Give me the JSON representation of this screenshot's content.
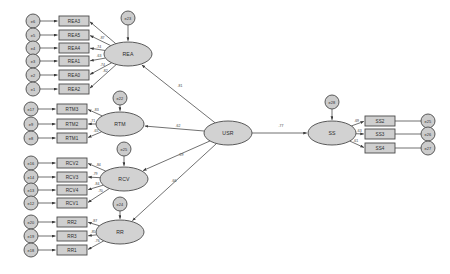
{
  "diagram": {
    "type": "sem-path-diagram",
    "title": "",
    "background_color": "#ffffff",
    "node_fill": "#cfcfcf",
    "node_stroke": "#4a4a4a",
    "edge_color": "#4d4d4d"
  },
  "latent_variables": [
    {
      "id": "REA",
      "label": "REA",
      "x": 128,
      "y": 54,
      "rx": 24,
      "ry": 12
    },
    {
      "id": "RTM",
      "label": "RTM",
      "x": 120,
      "y": 124,
      "rx": 24,
      "ry": 12
    },
    {
      "id": "RCV",
      "label": "RCV",
      "x": 124,
      "y": 179,
      "rx": 24,
      "ry": 12
    },
    {
      "id": "RR",
      "label": "RR",
      "x": 120,
      "y": 232,
      "rx": 24,
      "ry": 12
    },
    {
      "id": "USR",
      "label": "USR",
      "x": 228,
      "y": 133,
      "rx": 24,
      "ry": 12
    },
    {
      "id": "SS",
      "label": "SS",
      "x": 332,
      "y": 133,
      "rx": 24,
      "ry": 12
    }
  ],
  "disturbances": [
    {
      "id": "e23",
      "label": "e23",
      "x": 128,
      "y": 18,
      "r": 7,
      "target": "REA"
    },
    {
      "id": "e22",
      "label": "e22",
      "x": 120,
      "y": 98,
      "r": 7,
      "target": "RTM"
    },
    {
      "id": "e25d",
      "label": "e25",
      "x": 124,
      "y": 149,
      "r": 7,
      "target": "RCV"
    },
    {
      "id": "e24",
      "label": "e24",
      "x": 120,
      "y": 204,
      "r": 7,
      "target": "RR"
    },
    {
      "id": "e28",
      "label": "e28",
      "x": 332,
      "y": 102,
      "r": 7,
      "target": "SS"
    }
  ],
  "indicators": [
    {
      "id": "REA3",
      "label": "REA3",
      "x": 74,
      "y": 21,
      "w": 30,
      "h": 10,
      "latent": "REA",
      "error": "e6",
      "coef": ""
    },
    {
      "id": "REA5",
      "label": "REA5",
      "x": 74,
      "y": 35,
      "w": 30,
      "h": 10,
      "latent": "REA",
      "error": "e5",
      "coef": ".87"
    },
    {
      "id": "REA4",
      "label": "REA4",
      "x": 74,
      "y": 48,
      "w": 30,
      "h": 10,
      "latent": "REA",
      "error": "e4",
      "coef": ".74"
    },
    {
      "id": "REA1",
      "label": "REA1",
      "x": 74,
      "y": 61,
      "w": 30,
      "h": 10,
      "latent": "REA",
      "error": "e3",
      "coef": ".63"
    },
    {
      "id": "REA0",
      "label": "REA0",
      "x": 74,
      "y": 75,
      "w": 30,
      "h": 10,
      "latent": "REA",
      "error": "e2",
      "coef": ".74"
    },
    {
      "id": "REA2",
      "label": "REA2",
      "x": 74,
      "y": 89,
      "w": 30,
      "h": 10,
      "latent": "REA",
      "error": "e1",
      "coef": ".82"
    },
    {
      "id": "RTM3",
      "label": "RTM3",
      "x": 72,
      "y": 109,
      "w": 30,
      "h": 10,
      "latent": "RTM",
      "error": "e17",
      "coef": ".83"
    },
    {
      "id": "RTM2",
      "label": "RTM2",
      "x": 72,
      "y": 124,
      "w": 30,
      "h": 10,
      "latent": "RTM",
      "error": "e9",
      "coef": ".71"
    },
    {
      "id": "RTM1",
      "label": "RTM1",
      "x": 72,
      "y": 138,
      "w": 30,
      "h": 10,
      "latent": "RTM",
      "error": "e8",
      "coef": ".65"
    },
    {
      "id": "RCV2",
      "label": "RCV2",
      "x": 72,
      "y": 163,
      "w": 30,
      "h": 10,
      "latent": "RCV",
      "error": "e16",
      "coef": ".84"
    },
    {
      "id": "RCV3",
      "label": "RCV3",
      "x": 72,
      "y": 177,
      "w": 30,
      "h": 10,
      "latent": "RCV",
      "error": "e14",
      "coef": ".79"
    },
    {
      "id": "RCV4",
      "label": "RCV4",
      "x": 72,
      "y": 190,
      "w": 30,
      "h": 10,
      "latent": "RCV",
      "error": "e13",
      "coef": ".84"
    },
    {
      "id": "RCV1",
      "label": "RCV1",
      "x": 72,
      "y": 203,
      "w": 30,
      "h": 10,
      "latent": "RCV",
      "error": "e12",
      "coef": ".70"
    },
    {
      "id": "RR2",
      "label": "RR2",
      "x": 72,
      "y": 222,
      "w": 30,
      "h": 10,
      "latent": "RR",
      "error": "e20",
      "coef": ".87"
    },
    {
      "id": "RR3",
      "label": "RR3",
      "x": 72,
      "y": 236,
      "w": 30,
      "h": 10,
      "latent": "RR",
      "error": "e19",
      "coef": ".85"
    },
    {
      "id": "RR1",
      "label": "RR1",
      "x": 72,
      "y": 250,
      "w": 30,
      "h": 10,
      "latent": "RR",
      "error": "e18",
      "coef": ".76"
    },
    {
      "id": "SS2",
      "label": "SS2",
      "x": 380,
      "y": 121,
      "w": 30,
      "h": 10,
      "latent": "SS",
      "error": "e25",
      "coef": ".69"
    },
    {
      "id": "SS3",
      "label": "SS3",
      "x": 380,
      "y": 134,
      "w": 30,
      "h": 10,
      "latent": "SS",
      "error": "e26",
      "coef": ".63"
    },
    {
      "id": "SS4",
      "label": "SS4",
      "x": 380,
      "y": 148,
      "w": 30,
      "h": 10,
      "latent": "SS",
      "error": "e27",
      "coef": ".61"
    }
  ],
  "error_terms": [
    {
      "id": "e6",
      "label": "e6",
      "x": 33,
      "y": 21,
      "r": 7
    },
    {
      "id": "e5",
      "label": "e5",
      "x": 33,
      "y": 35,
      "r": 7
    },
    {
      "id": "e4",
      "label": "e4",
      "x": 33,
      "y": 48,
      "r": 7
    },
    {
      "id": "e3",
      "label": "e3",
      "x": 33,
      "y": 61,
      "r": 7
    },
    {
      "id": "e2",
      "label": "e2",
      "x": 33,
      "y": 75,
      "r": 7
    },
    {
      "id": "e1",
      "label": "e1",
      "x": 33,
      "y": 89,
      "r": 7
    },
    {
      "id": "e17",
      "label": "e17",
      "x": 31,
      "y": 109,
      "r": 7
    },
    {
      "id": "e9",
      "label": "e9",
      "x": 31,
      "y": 124,
      "r": 7
    },
    {
      "id": "e8",
      "label": "e8",
      "x": 31,
      "y": 138,
      "r": 7
    },
    {
      "id": "e16",
      "label": "e16",
      "x": 31,
      "y": 163,
      "r": 7
    },
    {
      "id": "e14",
      "label": "e14",
      "x": 31,
      "y": 177,
      "r": 7
    },
    {
      "id": "e13",
      "label": "e13",
      "x": 31,
      "y": 190,
      "r": 7
    },
    {
      "id": "e12",
      "label": "e12",
      "x": 31,
      "y": 203,
      "r": 7
    },
    {
      "id": "e20",
      "label": "e20",
      "x": 31,
      "y": 222,
      "r": 7
    },
    {
      "id": "e19",
      "label": "e19",
      "x": 31,
      "y": 236,
      "r": 7
    },
    {
      "id": "e18",
      "label": "e18",
      "x": 31,
      "y": 250,
      "r": 7
    },
    {
      "id": "e25",
      "label": "e25",
      "x": 428,
      "y": 121,
      "r": 7
    },
    {
      "id": "e26",
      "label": "e26",
      "x": 428,
      "y": 134,
      "r": 7
    },
    {
      "id": "e27",
      "label": "e27",
      "x": 428,
      "y": 148,
      "r": 7
    }
  ],
  "structural_paths": [
    {
      "id": "usr-rea",
      "from": "USR",
      "to": "REA",
      "coef": ".81",
      "label_x": 180,
      "label_y": 86
    },
    {
      "id": "usr-rtm",
      "from": "USR",
      "to": "RTM",
      "coef": ".62",
      "label_x": 178,
      "label_y": 126
    },
    {
      "id": "usr-rcv",
      "from": "USR",
      "to": "RCV",
      "coef": ".59",
      "label_x": 181,
      "label_y": 155
    },
    {
      "id": "usr-rr",
      "from": "USR",
      "to": "RR",
      "coef": ".66",
      "label_x": 174,
      "label_y": 181
    },
    {
      "id": "usr-ss",
      "from": "USR",
      "to": "SS",
      "coef": ".77",
      "label_x": 281,
      "label_y": 126
    }
  ]
}
